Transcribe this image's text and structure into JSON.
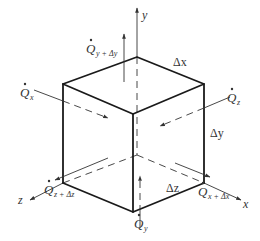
{
  "figure": {
    "type": "control-volume-heat-flow",
    "axes": {
      "x": "x",
      "y": "y",
      "z": "z"
    },
    "dimensions": {
      "dx": "Δx",
      "dy": "Δy",
      "dz": "Δz"
    },
    "flows": {
      "qx": {
        "sym": "Q",
        "sub": "x"
      },
      "qx_dx": {
        "sym": "Q",
        "sub": "x + Δx"
      },
      "qy": {
        "sym": "Q",
        "sub": "y"
      },
      "qy_dy": {
        "sym": "Q",
        "sub": "y + Δy"
      },
      "qz": {
        "sym": "Q",
        "sub": "z"
      },
      "qz_dz": {
        "sym": "Q",
        "sub": "z + Δz"
      }
    },
    "colors": {
      "line": "#1a1a1a",
      "text": "#333333",
      "background": "#ffffff"
    }
  }
}
